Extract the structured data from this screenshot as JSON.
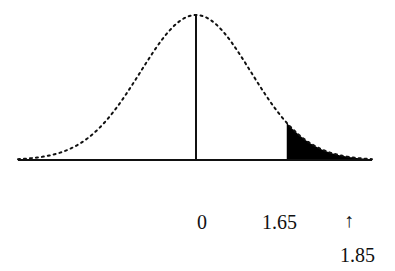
{
  "chart_data": {
    "type": "area",
    "title": "",
    "xlabel": "",
    "ylabel": "",
    "distribution": "standard normal",
    "mean": 0,
    "x_range": [
      -3.2,
      3.2
    ],
    "shaded_region": {
      "from": 1.65,
      "to": 3.2,
      "tail": "right",
      "color": "#000000"
    },
    "center_line": 0,
    "tick_labels": [
      "0",
      "1.65"
    ],
    "annotations": [
      {
        "text": "↑",
        "x": 1.85,
        "role": "arrow-pointer"
      },
      {
        "text": "1.85",
        "x": 1.85,
        "role": "value-label"
      }
    ],
    "curve_style": "dotted",
    "grid": false,
    "legend": false
  },
  "labels": {
    "zero": "0",
    "critical": "1.65",
    "arrow": "↑",
    "observed": "1.85"
  }
}
